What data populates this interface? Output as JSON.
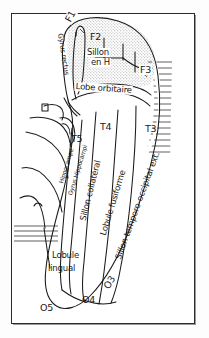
{
  "figure": {
    "language": "fr",
    "style": "hand-drawn anatomical line diagram",
    "frame": {
      "border_color": "#2b2b2b",
      "background": "#ffffff"
    },
    "ink_color": "#1a1a1a",
    "fills": {
      "orbital_lobe_stipple": "#d9d9d9",
      "lateral_hatch": "#1a1a1a"
    }
  },
  "labels": {
    "f1": "F1",
    "f2": "F2",
    "f3": "F3",
    "gyrus_rectus": "Gyrus rectus",
    "sillon_en_h_line1": "Sillon",
    "sillon_en_h_line2": "en H",
    "lobe_orbitaire": "Lobe orbitaire",
    "t3": "T3",
    "t4": "T4",
    "t5": "T5",
    "hippocampe": "Hippocampe",
    "gyrus_hippocampi": "Gyrus Hippocampi",
    "sillon_collateral": "Sillon collatéral",
    "lobule_fusiforme": "Lobule fusiforme",
    "sillon_temporo_occipital": "Sillon temporo-occipital ext.",
    "lobule_lingual_line1": "Lobule",
    "lobule_lingual_line2": "lingual",
    "o3": "O3",
    "o4": "O4",
    "o5": "O5"
  }
}
